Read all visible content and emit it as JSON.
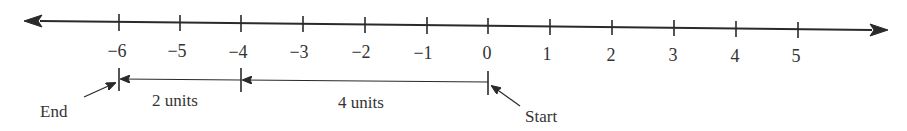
{
  "diagram": {
    "type": "number-line",
    "ticks": [
      -6,
      -5,
      -4,
      -3,
      -2,
      -1,
      0,
      1,
      2,
      3,
      4,
      5
    ],
    "tick_labels": [
      "−6",
      "−5",
      "−4",
      "−3",
      "−2",
      "−1",
      "0",
      "1",
      "2",
      "3",
      "4",
      "5"
    ],
    "segments": [
      {
        "from": -4,
        "to": -6,
        "label": "2 units"
      },
      {
        "from": 0,
        "to": -4,
        "label": "4 units"
      }
    ],
    "annotations": {
      "start": {
        "value": 0,
        "label": "Start"
      },
      "end": {
        "value": -6,
        "label": "End"
      }
    }
  }
}
